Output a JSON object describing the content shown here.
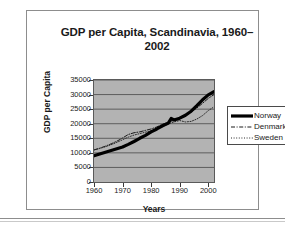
{
  "chart_data": {
    "type": "line",
    "title_line1": "GDP per Capita, Scandinavia, 1960–",
    "title_line2": "2002",
    "xlabel": "Years",
    "ylabel": "GDP per Capita",
    "xlim": [
      1960,
      2002
    ],
    "ylim": [
      0,
      35000
    ],
    "grid": "horizontal",
    "legend_position": "right",
    "plot_background": "#b3b3b3",
    "yticks": [
      0,
      5000,
      10000,
      15000,
      20000,
      25000,
      30000,
      35000
    ],
    "ytick_labels": [
      "0",
      "5000",
      "10000",
      "15000",
      "20000",
      "25000",
      "30000",
      "35000"
    ],
    "xticks": [
      1960,
      1970,
      1980,
      1990,
      2000
    ],
    "xtick_labels": [
      "1960",
      "1970",
      "1980",
      "1990",
      "2000"
    ],
    "x": [
      1960,
      1962,
      1964,
      1966,
      1968,
      1970,
      1972,
      1974,
      1976,
      1978,
      1980,
      1982,
      1984,
      1986,
      1987,
      1988,
      1990,
      1992,
      1994,
      1996,
      1998,
      2000,
      2002
    ],
    "series": [
      {
        "name": "Norway",
        "style": "solid-thick",
        "color": "#000000",
        "values": [
          9000,
          9600,
          10200,
          10800,
          11400,
          12000,
          12900,
          13900,
          15000,
          16000,
          17200,
          18200,
          19300,
          20200,
          21800,
          21300,
          21900,
          22900,
          24300,
          26200,
          28200,
          29900,
          31000
        ]
      },
      {
        "name": "Denmark",
        "style": "dash-dot",
        "color": "#1a1a1a",
        "values": [
          11000,
          11600,
          12300,
          13100,
          14000,
          15100,
          16300,
          16900,
          17200,
          17700,
          18200,
          18900,
          19800,
          20500,
          20900,
          21100,
          21700,
          22600,
          24000,
          25400,
          27000,
          28700,
          30000
        ]
      },
      {
        "name": "Sweden",
        "style": "dotted",
        "color": "#2b2b2b",
        "values": [
          11000,
          11500,
          12100,
          12800,
          13600,
          14500,
          15400,
          16100,
          16600,
          17100,
          17600,
          18200,
          19000,
          19800,
          20300,
          20600,
          21100,
          20600,
          20800,
          21600,
          22800,
          24500,
          25800
        ]
      }
    ],
    "legend": [
      {
        "label": "Norway",
        "style": "solid-thick"
      },
      {
        "label": "Denmark",
        "style": "dash-dot"
      },
      {
        "label": "Sweden",
        "style": "dotted"
      }
    ]
  }
}
